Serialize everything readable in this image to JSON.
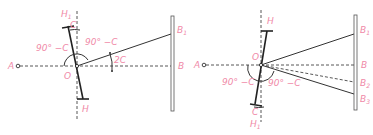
{
  "figure": {
    "colors": {
      "label": "#f08aa8",
      "line": "#333333",
      "background": "#ffffff"
    },
    "left_diagram": {
      "labels": {
        "A": "A",
        "O": "O",
        "B": "B",
        "B1": "B",
        "B1_sub": "1",
        "H": "H",
        "H1": "H",
        "H1_sub": "1",
        "C": "C",
        "angle_left": "90° −C",
        "angle_right": "90° −C",
        "angle_2c": "2C"
      }
    },
    "right_diagram": {
      "labels": {
        "A": "A",
        "O": "O",
        "B": "B",
        "B1": "B",
        "B1_sub": "1",
        "B2": "B",
        "B2_sub": "2",
        "B3": "B",
        "B3_sub": "3",
        "H": "H",
        "H1": "H",
        "H1_sub": "1",
        "C": "C",
        "angle_left": "90° −C",
        "angle_right": "90° −C"
      }
    }
  }
}
